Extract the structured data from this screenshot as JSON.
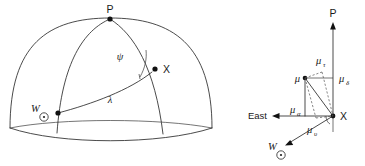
{
  "figure": {
    "title": "",
    "background_color": "#ffffff",
    "line_color": "#2b2b2b",
    "width": 365,
    "height": 166
  },
  "left_panel": {
    "name": "celestial-sphere-diagram",
    "description": "Hemisphere with great circle arcs through pole P, star X and solar apex W",
    "labels": {
      "pole": "P",
      "star": "X",
      "apex": "W",
      "apex_subscript": "⊙",
      "angle_psi": "ψ",
      "arc_lambda": "λ"
    }
  },
  "right_panel": {
    "name": "proper-motion-vector-diagram",
    "description": "Vector decomposition of proper motion mu at star X into components",
    "labels": {
      "pole": "P",
      "star": "X",
      "east": "East",
      "apex": "W",
      "apex_subscript": "⊙",
      "mu": "μ",
      "mu_tau": "μ",
      "mu_tau_sub": "τ",
      "mu_delta": "μ",
      "mu_delta_sub": "δ",
      "mu_alpha": "μ",
      "mu_alpha_sub": "α",
      "mu_upsilon": "μ",
      "mu_upsilon_sub": "υ"
    }
  }
}
